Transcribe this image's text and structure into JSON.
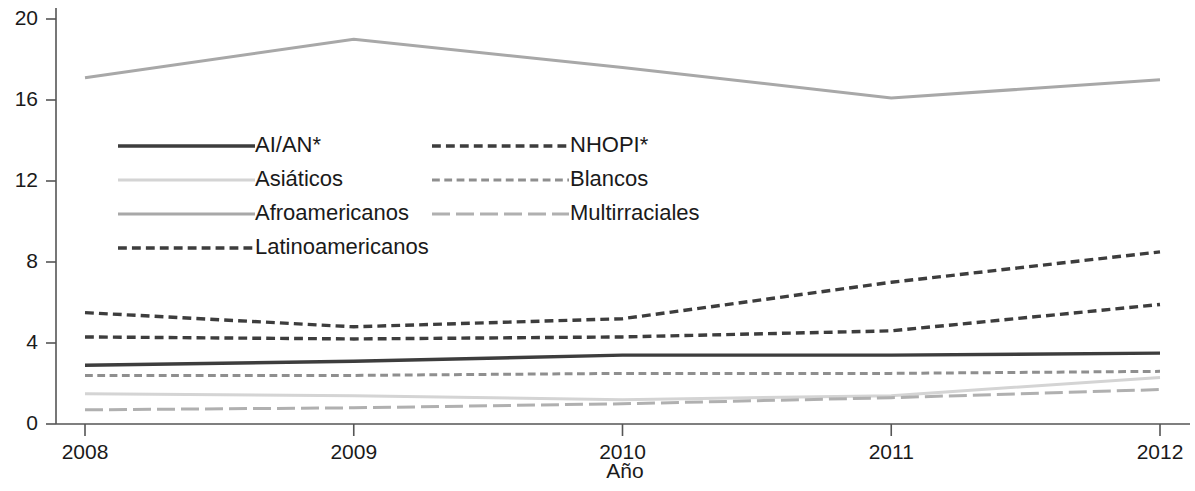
{
  "chart_data": {
    "type": "line",
    "title": "",
    "xlabel": "Año",
    "ylabel": "",
    "x": [
      2008,
      2009,
      2010,
      2011,
      2012
    ],
    "xtick_labels": [
      "2008",
      "2009",
      "2010",
      "2011",
      "2012"
    ],
    "ytick_labels": [
      "0",
      "4",
      "8",
      "12",
      "16",
      "20"
    ],
    "yticks": [
      0,
      4,
      8,
      12,
      16,
      20
    ],
    "ylim": [
      0,
      20.3
    ],
    "xlim": [
      2008,
      2012
    ],
    "grid": false,
    "legend_position": "upper-left-inside",
    "series": [
      {
        "name": "AI/AN*",
        "style": "solid",
        "color": "#3d3d3d",
        "width": 3.4,
        "values": [
          2.9,
          3.1,
          3.4,
          3.4,
          3.5
        ]
      },
      {
        "name": "Asiáticos",
        "style": "solid",
        "color": "#d4d4d4",
        "width": 3.0,
        "values": [
          1.5,
          1.4,
          1.2,
          1.4,
          2.3
        ]
      },
      {
        "name": "Afroamericanos",
        "style": "solid",
        "color": "#a8a8a8",
        "width": 3.0,
        "values": [
          17.1,
          19.0,
          17.6,
          16.1,
          17.0
        ]
      },
      {
        "name": "Latinoamericanos",
        "style": "dashed",
        "color": "#3d3d3d",
        "width": 3.4,
        "values": [
          5.5,
          4.8,
          5.2,
          7.0,
          8.5
        ]
      },
      {
        "name": "NHOPI*",
        "style": "dashed",
        "color": "#3d3d3d",
        "width": 3.4,
        "values": [
          4.3,
          4.2,
          4.3,
          4.6,
          5.9
        ]
      },
      {
        "name": "Blancos",
        "style": "dashed",
        "color": "#8f8f8f",
        "width": 3.0,
        "values": [
          2.4,
          2.4,
          2.5,
          2.5,
          2.6
        ]
      },
      {
        "name": "Multirraciales",
        "style": "longdash",
        "color": "#b0b0b0",
        "width": 3.0,
        "values": [
          0.7,
          0.8,
          1.0,
          1.3,
          1.7
        ]
      }
    ]
  },
  "legend": {
    "column_left": [
      {
        "label": "AI/AN*",
        "series": "AI/AN*"
      },
      {
        "label": "Asiáticos",
        "series": "Asiáticos"
      },
      {
        "label": "Afroamericanos",
        "series": "Afroamericanos"
      },
      {
        "label": "Latinoamericanos",
        "series": "Latinoamericanos"
      }
    ],
    "column_right": [
      {
        "label": "NHOPI*",
        "series": "NHOPI*"
      },
      {
        "label": "Blancos",
        "series": "Blancos"
      },
      {
        "label": "Multirraciales",
        "series": "Multirraciales"
      }
    ]
  },
  "axes": {
    "x_title": "Año",
    "y_ticks": [
      "20",
      "16",
      "12",
      "8",
      "4",
      "0"
    ],
    "x_ticks": [
      "2008",
      "2009",
      "2010",
      "2011",
      "2012"
    ]
  }
}
